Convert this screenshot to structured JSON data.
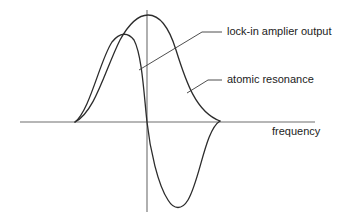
{
  "diagram": {
    "title": "",
    "labels": {
      "lockin": "lock-in amplier output",
      "atomic": "atomic resonance",
      "x_axis": "frequency"
    },
    "colors": {
      "background": "#ffffff",
      "curve": "#2c2c2c",
      "axis": "#6e6e6e",
      "text": "#222222"
    },
    "elements": [
      {
        "type": "axis",
        "name": "frequency-axis",
        "orientation": "horizontal"
      },
      {
        "type": "axis",
        "name": "vertical-axis",
        "orientation": "vertical"
      },
      {
        "type": "curve",
        "name": "atomic-resonance-curve",
        "shape": "bell/Lorentzian peak"
      },
      {
        "type": "curve",
        "name": "lock-in-output-curve",
        "shape": "dispersive derivative (positive lobe then negative lobe)"
      }
    ]
  }
}
